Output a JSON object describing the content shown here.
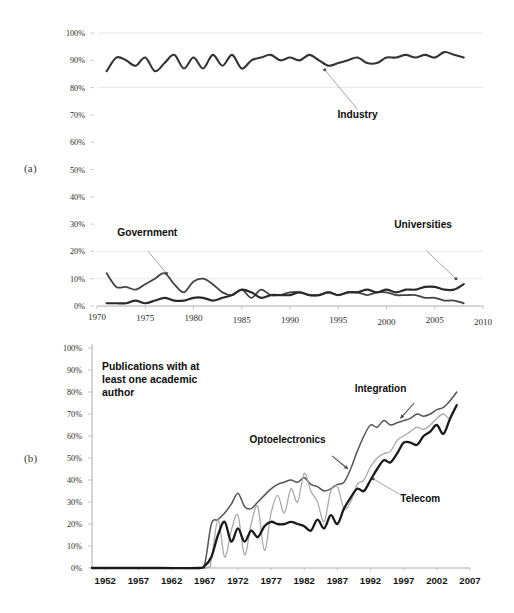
{
  "figure": {
    "background": "#ffffff",
    "panels": [
      {
        "id": "a",
        "label": "(a)"
      },
      {
        "id": "b",
        "label": "(b)"
      }
    ]
  },
  "chart_data": [
    {
      "id": "panel-a",
      "type": "line",
      "title": "",
      "xlabel": "",
      "ylabel": "",
      "xlim": [
        1970,
        2010
      ],
      "ylim": [
        0,
        100
      ],
      "grid": true,
      "legend_position": "inline-annotations",
      "x_ticks": [
        1970,
        1975,
        1980,
        1985,
        1990,
        1995,
        2000,
        2005,
        2010
      ],
      "y_ticks": [
        0,
        10,
        20,
        30,
        40,
        50,
        60,
        70,
        80,
        90,
        100
      ],
      "y_tick_labels": [
        "0%",
        "10%",
        "20%",
        "30%",
        "40%",
        "50%",
        "60%",
        "70%",
        "80%",
        "90%",
        "100%"
      ],
      "x_tick_labels": [
        "1970",
        "1975",
        "1980",
        "1985",
        "1990",
        "1995",
        "2000",
        "2005",
        "2010"
      ],
      "annotations": [
        {
          "text": "Industry",
          "x": 1994,
          "y": 74
        },
        {
          "text": "Government",
          "x": 1974,
          "y": 27
        },
        {
          "text": "Universities",
          "x": 2003,
          "y": 27
        }
      ],
      "series": [
        {
          "name": "Industry",
          "color": "#333333",
          "width": 2.1,
          "x": [
            1971,
            1972,
            1973,
            1974,
            1975,
            1976,
            1977,
            1978,
            1979,
            1980,
            1981,
            1982,
            1983,
            1984,
            1985,
            1986,
            1987,
            1988,
            1989,
            1990,
            1991,
            1992,
            1993,
            1994,
            1995,
            1996,
            1997,
            1998,
            1999,
            2000,
            2001,
            2002,
            2003,
            2004,
            2005,
            2006,
            2007,
            2008
          ],
          "values": [
            86,
            91,
            90,
            88,
            91,
            86,
            89,
            92,
            87,
            91,
            87,
            92,
            88,
            92,
            87,
            90,
            91,
            92,
            90,
            91,
            90,
            92,
            90,
            88,
            89,
            90,
            91,
            89,
            89,
            91,
            91,
            92,
            91,
            92,
            91,
            93,
            92,
            91
          ]
        },
        {
          "name": "Government",
          "color": "#444444",
          "width": 1.8,
          "x": [
            1971,
            1972,
            1973,
            1974,
            1975,
            1976,
            1977,
            1978,
            1979,
            1980,
            1981,
            1982,
            1983,
            1984,
            1985,
            1986,
            1987,
            1988,
            1989,
            1990,
            1991,
            1992,
            1993,
            1994,
            1995,
            1996,
            1997,
            1998,
            1999,
            2000,
            2001,
            2002,
            2003,
            2004,
            2005,
            2006,
            2007,
            2008
          ],
          "values": [
            12,
            7,
            7,
            6,
            8,
            10,
            12,
            8,
            5,
            9,
            10,
            8,
            5,
            4,
            6,
            3,
            6,
            4,
            4,
            5,
            5,
            4,
            4,
            5,
            4,
            5,
            5,
            4,
            5,
            5,
            4,
            4,
            4,
            3,
            3,
            2,
            2,
            1
          ]
        },
        {
          "name": "Universities",
          "color": "#2a2a2a",
          "width": 2.2,
          "x": [
            1971,
            1972,
            1973,
            1974,
            1975,
            1976,
            1977,
            1978,
            1979,
            1980,
            1981,
            1982,
            1983,
            1984,
            1985,
            1986,
            1987,
            1988,
            1989,
            1990,
            1991,
            1992,
            1993,
            1994,
            1995,
            1996,
            1997,
            1998,
            1999,
            2000,
            2001,
            2002,
            2003,
            2004,
            2005,
            2006,
            2007,
            2008
          ],
          "values": [
            1,
            1,
            1,
            2,
            1,
            2,
            3,
            2,
            2,
            3,
            3,
            2,
            3,
            4,
            6,
            5,
            3,
            4,
            4,
            4,
            5,
            4,
            4,
            5,
            4,
            5,
            5,
            6,
            5,
            6,
            5,
            6,
            6,
            7,
            7,
            6,
            6,
            8
          ]
        }
      ]
    },
    {
      "id": "panel-b",
      "type": "line",
      "title": "Publications with at least one academic author",
      "xlabel": "",
      "ylabel": "",
      "xlim": [
        1950,
        2007
      ],
      "ylim": [
        0,
        100
      ],
      "grid": false,
      "legend_position": "inline-annotations",
      "x_ticks": [
        1952,
        1957,
        1962,
        1967,
        1972,
        1977,
        1982,
        1987,
        1992,
        1997,
        2002,
        2007
      ],
      "y_ticks": [
        0,
        10,
        20,
        30,
        40,
        50,
        60,
        70,
        80,
        90,
        100
      ],
      "y_tick_labels": [
        "0%",
        "10%",
        "20%",
        "30%",
        "40%",
        "50%",
        "60%",
        "70%",
        "80%",
        "90%",
        "100%"
      ],
      "x_tick_labels": [
        "1952",
        "1957",
        "1962",
        "1967",
        "1972",
        "1977",
        "1982",
        "1987",
        "1992",
        "1997",
        "2002",
        "2007"
      ],
      "note": "Publications with at least one academic author",
      "note_lines": [
        "Publications with at",
        "least one academic",
        "author"
      ],
      "annotations": [
        {
          "text": "Integration",
          "x": 1992,
          "y": 82
        },
        {
          "text": "Optoelectronics",
          "x": 1979,
          "y": 59
        },
        {
          "text": "Telecom",
          "x": 1998,
          "y": 33
        }
      ],
      "series": [
        {
          "name": "Integration",
          "color": "#555555",
          "width": 1.5,
          "x": [
            1950,
            1960,
            1966,
            1967,
            1968,
            1969,
            1970,
            1971,
            1972,
            1973,
            1974,
            1975,
            1976,
            1977,
            1978,
            1979,
            1980,
            1981,
            1982,
            1983,
            1984,
            1985,
            1986,
            1987,
            1988,
            1989,
            1990,
            1991,
            1992,
            1993,
            1994,
            1995,
            1996,
            1997,
            1998,
            1999,
            2000,
            2001,
            2002,
            2003,
            2004,
            2005
          ],
          "values": [
            0,
            0,
            0,
            2,
            20,
            22,
            25,
            29,
            34,
            28,
            27,
            30,
            33,
            36,
            38,
            39,
            40,
            39,
            41,
            38,
            37,
            35,
            36,
            38,
            39,
            45,
            53,
            60,
            65,
            64,
            67,
            65,
            66,
            67,
            68,
            70,
            69,
            70,
            72,
            73,
            76,
            80
          ]
        },
        {
          "name": "Optoelectronics",
          "color": "#aaaaaa",
          "width": 1.3,
          "x": [
            1950,
            1960,
            1967,
            1968,
            1969,
            1970,
            1971,
            1972,
            1973,
            1974,
            1975,
            1976,
            1977,
            1978,
            1979,
            1980,
            1981,
            1982,
            1983,
            1984,
            1985,
            1986,
            1987,
            1988,
            1989,
            1990,
            1991,
            1992,
            1993,
            1994,
            1995,
            1996,
            1997,
            1998,
            1999,
            2000,
            2001,
            2002,
            2003,
            2004,
            2005
          ],
          "values": [
            0,
            0,
            0,
            4,
            22,
            5,
            17,
            24,
            6,
            20,
            28,
            8,
            25,
            33,
            25,
            36,
            30,
            43,
            35,
            30,
            21,
            35,
            37,
            27,
            30,
            38,
            40,
            46,
            50,
            52,
            53,
            58,
            60,
            62,
            64,
            63,
            65,
            68,
            70,
            68,
            74
          ]
        },
        {
          "name": "Telecom",
          "color": "#1a1a1a",
          "width": 2.3,
          "x": [
            1950,
            1960,
            1966,
            1967,
            1968,
            1969,
            1970,
            1971,
            1972,
            1973,
            1974,
            1975,
            1976,
            1977,
            1978,
            1979,
            1980,
            1981,
            1982,
            1983,
            1984,
            1985,
            1986,
            1987,
            1988,
            1989,
            1990,
            1991,
            1992,
            1993,
            1994,
            1995,
            1996,
            1997,
            1998,
            1999,
            2000,
            2001,
            2002,
            2003,
            2004,
            2005
          ],
          "values": [
            0,
            0,
            0,
            1,
            5,
            15,
            21,
            12,
            18,
            12,
            17,
            14,
            19,
            21,
            20,
            20,
            21,
            20,
            19,
            17,
            22,
            18,
            24,
            20,
            27,
            32,
            36,
            35,
            40,
            45,
            49,
            48,
            52,
            57,
            57,
            56,
            60,
            62,
            65,
            61,
            68,
            74
          ]
        }
      ]
    }
  ]
}
